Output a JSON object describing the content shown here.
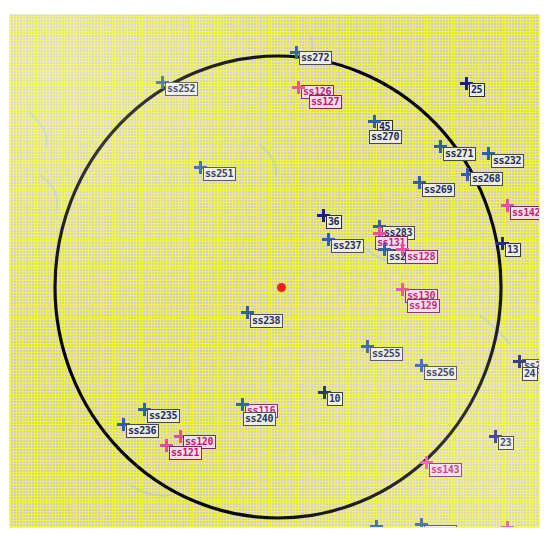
{
  "view": {
    "title": "site-annotation-map",
    "background_color": "#cfcdc6",
    "grid_color": "#e9e929",
    "boundary_color": "#000000",
    "center_marker_color": "#f01e12"
  },
  "boundary": {
    "shape": "circle",
    "center_x": 268,
    "center_y": 272,
    "radius_x": 223,
    "radius_y": 231
  },
  "center_point": {
    "x": 271,
    "y": 272,
    "label": ""
  },
  "markers": [
    {
      "id": "m01",
      "label": "ss272",
      "x": 286,
      "y": 37,
      "color": "blue",
      "label_dx": 3,
      "label_dy": -1
    },
    {
      "id": "m02",
      "label": "ss252",
      "x": 152,
      "y": 67,
      "color": "blue",
      "label_dx": 3,
      "label_dy": 0
    },
    {
      "id": "m03",
      "label": "ss126",
      "x": 288,
      "y": 72,
      "color": "pink",
      "label_dx": 3,
      "label_dy": -2
    },
    {
      "id": "m04",
      "label": "ss127",
      "x": 288,
      "y": 72,
      "color": "pink",
      "label_dx": 11,
      "label_dy": 8
    },
    {
      "id": "m05",
      "label": "25",
      "x": 456,
      "y": 68,
      "color": "navy",
      "label_dx": 3,
      "label_dy": 0
    },
    {
      "id": "m06",
      "label": "45",
      "x": 364,
      "y": 106,
      "color": "navy",
      "label_dx": 3,
      "label_dy": -1
    },
    {
      "id": "m07",
      "label": "ss270",
      "x": 364,
      "y": 106,
      "color": "blue",
      "label_dx": -5,
      "label_dy": 9
    },
    {
      "id": "m08",
      "label": "ss271",
      "x": 430,
      "y": 131,
      "color": "blue",
      "label_dx": 3,
      "label_dy": 1
    },
    {
      "id": "m09",
      "label": "ss232",
      "x": 478,
      "y": 138,
      "color": "blue",
      "label_dx": 3,
      "label_dy": 1
    },
    {
      "id": "m10",
      "label": "ss251",
      "x": 190,
      "y": 152,
      "color": "blue",
      "label_dx": 3,
      "label_dy": 0
    },
    {
      "id": "m11",
      "label": "ss268",
      "x": 457,
      "y": 159,
      "color": "blue",
      "label_dx": 3,
      "label_dy": -2
    },
    {
      "id": "m12",
      "label": "ss269",
      "x": 409,
      "y": 167,
      "color": "blue",
      "label_dx": 3,
      "label_dy": 1
    },
    {
      "id": "m13",
      "label": "ss142",
      "x": 497,
      "y": 190,
      "color": "pink",
      "label_dx": 3,
      "label_dy": 1
    },
    {
      "id": "m14",
      "label": "36",
      "x": 313,
      "y": 200,
      "color": "navy",
      "label_dx": 3,
      "label_dy": 0
    },
    {
      "id": "m15",
      "label": "ss283",
      "x": 369,
      "y": 211,
      "color": "blue",
      "label_dx": 3,
      "label_dy": 0
    },
    {
      "id": "m16",
      "label": "13",
      "x": 492,
      "y": 228,
      "color": "navy",
      "label_dx": 3,
      "label_dy": 0
    },
    {
      "id": "m17",
      "label": "ss131",
      "x": 369,
      "y": 218,
      "color": "pink",
      "label_dx": -4,
      "label_dy": 3
    },
    {
      "id": "m18",
      "label": "ss237",
      "x": 318,
      "y": 224,
      "color": "blue",
      "label_dx": 3,
      "label_dy": 0
    },
    {
      "id": "m19",
      "label": "ss2",
      "x": 374,
      "y": 234,
      "color": "blue",
      "label_dx": 0,
      "label_dy": 1
    },
    {
      "id": "m20",
      "label": "ss128",
      "x": 392,
      "y": 234,
      "color": "pink",
      "label_dx": 3,
      "label_dy": 1
    },
    {
      "id": "m21",
      "label": "ss130",
      "x": 392,
      "y": 274,
      "color": "pink",
      "label_dx": 3,
      "label_dy": 0
    },
    {
      "id": "m22",
      "label": "ss129",
      "x": 392,
      "y": 274,
      "color": "pink",
      "label_dx": 5,
      "label_dy": 10
    },
    {
      "id": "m23",
      "label": "ss238",
      "x": 237,
      "y": 297,
      "color": "blue",
      "label_dx": 3,
      "label_dy": 2
    },
    {
      "id": "m24",
      "label": "ss255",
      "x": 357,
      "y": 331,
      "color": "blue",
      "label_dx": 3,
      "label_dy": 1
    },
    {
      "id": "m25",
      "label": "ss256",
      "x": 411,
      "y": 350,
      "color": "blue",
      "label_dx": 3,
      "label_dy": 1
    },
    {
      "id": "m26",
      "label": "ss248",
      "x": 509,
      "y": 346,
      "color": "blue",
      "label_dx": 3,
      "label_dy": -2
    },
    {
      "id": "m27",
      "label": "24",
      "x": 509,
      "y": 346,
      "color": "navy",
      "label_dx": 3,
      "label_dy": 6
    },
    {
      "id": "m28",
      "label": "10",
      "x": 314,
      "y": 377,
      "color": "navy",
      "label_dx": 3,
      "label_dy": 0
    },
    {
      "id": "m29",
      "label": "ss235",
      "x": 134,
      "y": 394,
      "color": "blue",
      "label_dx": 3,
      "label_dy": 0
    },
    {
      "id": "m30",
      "label": "ss116",
      "x": 232,
      "y": 389,
      "color": "pink",
      "label_dx": 3,
      "label_dy": 0
    },
    {
      "id": "m31",
      "label": "ss240",
      "x": 232,
      "y": 389,
      "color": "blue",
      "label_dx": 1,
      "label_dy": 8
    },
    {
      "id": "m32",
      "label": "ss236",
      "x": 113,
      "y": 409,
      "color": "blue",
      "label_dx": 3,
      "label_dy": 0
    },
    {
      "id": "m33",
      "label": "ss120",
      "x": 170,
      "y": 421,
      "color": "pink",
      "label_dx": 3,
      "label_dy": -1
    },
    {
      "id": "m34",
      "label": "ss121",
      "x": 156,
      "y": 430,
      "color": "pink",
      "label_dx": 3,
      "label_dy": 1
    },
    {
      "id": "m35",
      "label": "23",
      "x": 485,
      "y": 421,
      "color": "navy",
      "label_dx": 3,
      "label_dy": 0
    },
    {
      "id": "m36",
      "label": "ss143",
      "x": 416,
      "y": 447,
      "color": "pink",
      "label_dx": 3,
      "label_dy": 1
    },
    {
      "id": "m37",
      "label": "ss200",
      "x": 366,
      "y": 511,
      "color": "blue",
      "label_dx": 3,
      "label_dy": 1
    },
    {
      "id": "m38",
      "label": "ss260",
      "x": 411,
      "y": 509,
      "color": "blue",
      "label_dx": 3,
      "label_dy": 1
    },
    {
      "id": "m39",
      "label": "ss111",
      "x": 497,
      "y": 512,
      "color": "pink",
      "label_dx": 3,
      "label_dy": 1
    }
  ]
}
